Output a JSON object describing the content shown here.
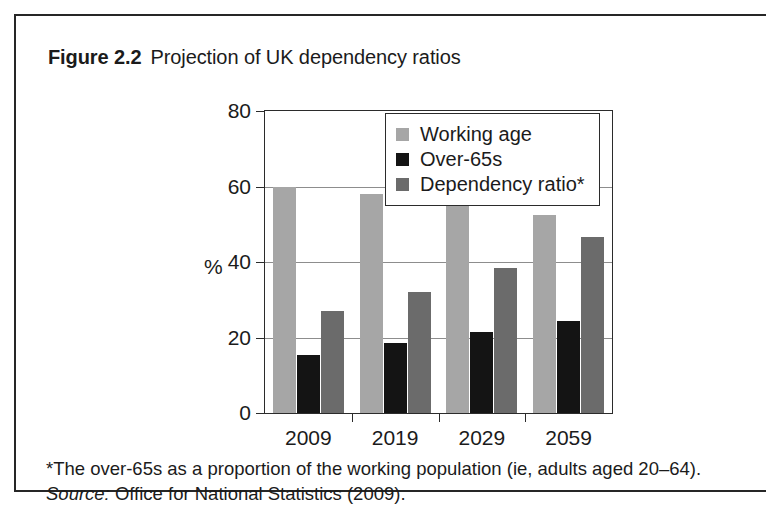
{
  "figure": {
    "label": "Figure 2.2",
    "caption": "Projection of UK dependency ratios"
  },
  "footnote": {
    "note": "*The over-65s as a proportion of the working population (ie, adults aged 20–64).",
    "source_word": "Source:",
    "source_text": "Office for National Statistics (2009)."
  },
  "colors": {
    "working_age": "#a6a6a6",
    "over_65s": "#141414",
    "dependency_ratio": "#6b6b6b",
    "axis": "#2b2b2b",
    "gridline": "#8d8d8d"
  },
  "chart_data": {
    "type": "bar",
    "title": "Projection of UK dependency ratios",
    "xlabel": "",
    "ylabel": "%",
    "ylim": [
      0,
      80
    ],
    "yticks": [
      0,
      20,
      40,
      60,
      80
    ],
    "grid": true,
    "legend_position": "top-right",
    "categories": [
      "2009",
      "2019",
      "2029",
      "2059"
    ],
    "series": [
      {
        "name": "Working age",
        "values": [
          60,
          58,
          55.5,
          52.5
        ]
      },
      {
        "name": "Over-65s",
        "values": [
          15.5,
          18.5,
          21.5,
          24.5
        ]
      },
      {
        "name": "Dependency ratio*",
        "values": [
          27,
          32,
          38.5,
          46.5
        ]
      }
    ]
  }
}
